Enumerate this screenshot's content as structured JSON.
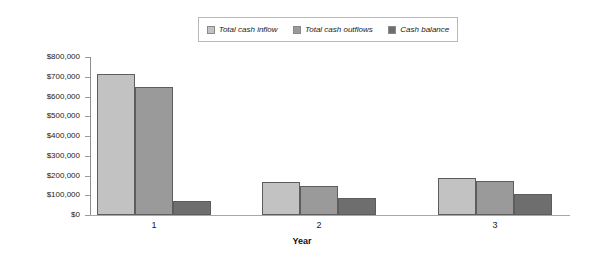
{
  "chart_data": {
    "type": "bar",
    "title": "",
    "xlabel": "Year",
    "ylabel": "",
    "categories": [
      "1",
      "2",
      "3"
    ],
    "ylim": [
      0,
      800000
    ],
    "ytick_step": 100000,
    "ytick_labels": [
      "$0",
      "$100,000",
      "$200,000",
      "$300,000",
      "$400,000",
      "$500,000",
      "$600,000",
      "$700,000",
      "$800,000"
    ],
    "ytick_values": [
      0,
      100000,
      200000,
      300000,
      400000,
      500000,
      600000,
      700000,
      800000
    ],
    "grid": false,
    "legend_position": "top-center",
    "series": [
      {
        "name": "Total cash inflow",
        "color": "#c2c2c2",
        "values": [
          715000,
          165000,
          185000
        ]
      },
      {
        "name": "Total cash outflows",
        "color": "#9a9a9a",
        "values": [
          650000,
          145000,
          170000
        ]
      },
      {
        "name": "Cash balance",
        "color": "#6e6e6e",
        "values": [
          70000,
          85000,
          105000
        ]
      }
    ]
  },
  "legend": {
    "items": [
      {
        "label": "Total cash inflow",
        "swatch": "#c2c2c2"
      },
      {
        "label": "Total cash outflows",
        "swatch": "#9a9a9a"
      },
      {
        "label": "Cash balance",
        "swatch": "#6e6e6e"
      }
    ]
  },
  "axis": {
    "x_title": "Year"
  }
}
